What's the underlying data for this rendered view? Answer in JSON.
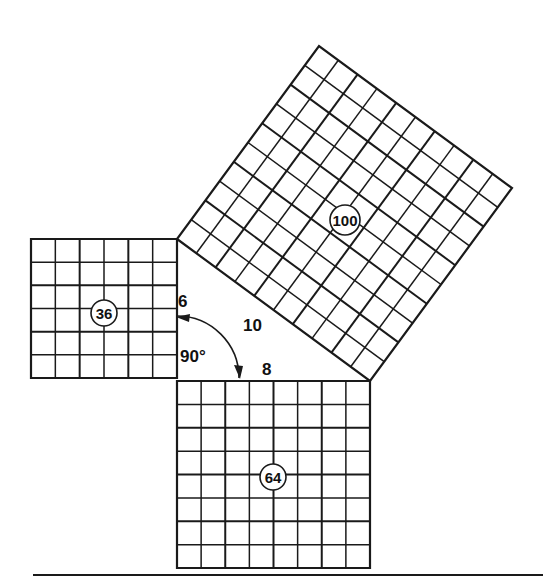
{
  "figure": {
    "canvas": {
      "width": 553,
      "height": 586,
      "background": "#ffffff"
    },
    "ink_color": "#1a1a1a"
  },
  "squares": [
    {
      "id": "square-36",
      "area_label": "36",
      "side_value": 6,
      "divisions": 6,
      "orientation": "axis-aligned",
      "corners": [
        [
          31,
          239
        ],
        [
          177,
          239
        ],
        [
          177,
          378
        ],
        [
          31,
          378
        ]
      ],
      "badge_center": [
        104,
        313
      ],
      "badge_radius": 13,
      "badge_font_size": 15
    },
    {
      "id": "square-64",
      "area_label": "64",
      "side_value": 8,
      "divisions": 8,
      "orientation": "axis-aligned",
      "corners": [
        [
          177,
          381
        ],
        [
          370,
          381
        ],
        [
          370,
          568
        ],
        [
          177,
          568
        ]
      ],
      "badge_center": [
        273,
        477
      ],
      "badge_radius": 13,
      "badge_font_size": 15
    },
    {
      "id": "square-100",
      "area_label": "100",
      "side_value": 10,
      "divisions": 10,
      "orientation": "rotated",
      "corners": [
        [
          177,
          239
        ],
        [
          370,
          381
        ],
        [
          512,
          188
        ],
        [
          319,
          46
        ]
      ],
      "badge_center": [
        345,
        220
      ],
      "badge_radius": 15,
      "badge_font_size": 15
    }
  ],
  "side_labels": [
    {
      "id": "label-leg-a",
      "text": "6",
      "x": 178,
      "y": 307
    },
    {
      "id": "label-hypotenuse",
      "text": "10",
      "x": 243,
      "y": 331
    },
    {
      "id": "label-leg-b",
      "text": "8",
      "x": 262,
      "y": 375
    },
    {
      "id": "label-right-angle",
      "text": "90°",
      "x": 180,
      "y": 362
    }
  ],
  "angle_marker": {
    "id": "right-angle-arc",
    "vertex": [
      177,
      378
    ],
    "radius": 62,
    "start_point": [
      177,
      316
    ],
    "end_point": [
      239,
      378
    ],
    "label": "90°"
  },
  "baseline": {
    "id": "bottom-rule",
    "x1": 33,
    "y1": 575,
    "x2": 543,
    "y2": 575
  },
  "relationship": {
    "equation": "36 + 64 = 100",
    "legs": [
      6,
      8
    ],
    "hypotenuse": 10,
    "right_angle_degrees": 90
  }
}
